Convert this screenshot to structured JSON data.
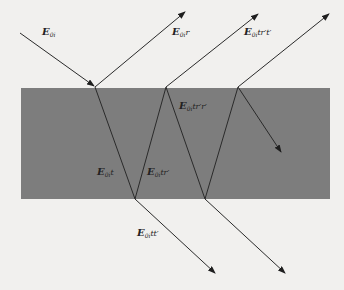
{
  "figure": {
    "colors": {
      "background": "#f1f0ee",
      "slab": "#7d7d7d",
      "ray": "#2a2a2a"
    },
    "slab": {
      "x": 21,
      "y": 88,
      "width": 309,
      "height": 111
    },
    "labels": {
      "incident": {
        "E": "E",
        "sub": "0i",
        "suffix": ""
      },
      "reflected_1": {
        "E": "E",
        "sub": "0i",
        "suffix": "r"
      },
      "reflected_2": {
        "E": "E",
        "sub": "0i",
        "suffix": "tr′t′"
      },
      "internal_down_1": {
        "E": "E",
        "sub": "0i",
        "suffix": "t"
      },
      "internal_up_1": {
        "E": "E",
        "sub": "0i",
        "suffix": "tr′"
      },
      "internal_down_2": {
        "E": "E",
        "sub": "0i",
        "suffix": "tr′r′"
      },
      "transmitted_1": {
        "E": "E",
        "sub": "0i",
        "suffix": "tt′"
      }
    },
    "rays": [
      {
        "name": "incident",
        "from": [
          20,
          33
        ],
        "to": [
          95,
          87
        ]
      },
      {
        "name": "reflected-1",
        "from": [
          95,
          87
        ],
        "to": [
          185,
          12
        ]
      },
      {
        "name": "reflected-2",
        "from": [
          166,
          87
        ],
        "to": [
          258,
          14
        ]
      },
      {
        "name": "reflected-3",
        "from": [
          238,
          87
        ],
        "to": [
          329,
          14
        ]
      },
      {
        "name": "internal-down-1",
        "from": [
          95,
          87
        ],
        "to": [
          135,
          199
        ]
      },
      {
        "name": "internal-up-1",
        "from": [
          135,
          199
        ],
        "to": [
          166,
          87
        ]
      },
      {
        "name": "internal-down-2",
        "from": [
          166,
          87
        ],
        "to": [
          205,
          199
        ]
      },
      {
        "name": "internal-up-2",
        "from": [
          205,
          199
        ],
        "to": [
          238,
          87
        ]
      },
      {
        "name": "internal-down-3",
        "from": [
          238,
          87
        ],
        "to": [
          281,
          152
        ]
      },
      {
        "name": "transmitted-1",
        "from": [
          135,
          199
        ],
        "to": [
          215,
          273
        ]
      },
      {
        "name": "transmitted-2",
        "from": [
          205,
          199
        ],
        "to": [
          285,
          273
        ]
      }
    ]
  }
}
